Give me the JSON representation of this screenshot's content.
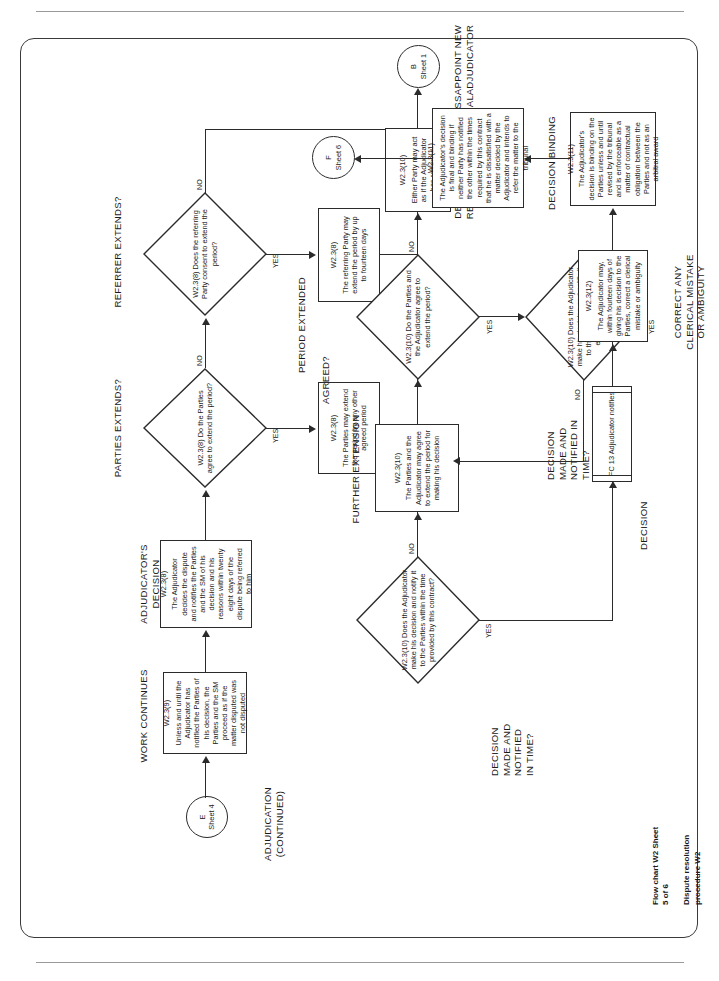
{
  "sheet": {
    "caption_line1": "Flow chart W2 Sheet 5 of 6",
    "caption_line2": "Dispute resolution procedure W2"
  },
  "section_headers": {
    "adjudication": "ADJUDICATION\n(CONTINUED)",
    "work_continues": "WORK CONTINUES",
    "adjudicators_decision": "ADJUDICATOR'S DECISION",
    "parties_extends": "PARTIES EXTENDS?",
    "referrer_extends": "REFERRER EXTENDS?",
    "period_extended": "PERIOD EXTENDED",
    "decision_made_notified_1": "DECISION\nMADE AND\nNOTIFIED\nIN TIME?",
    "further_extension": "FURTHER EXTENSION",
    "agreed": "AGREED?",
    "decision_made_notified_2": "DECISION\nMADE AND\nNOTIFIED IN\nTIME?",
    "appoint_new_adjudicator": "APPOINT NEW\nADJUDICATOR",
    "decision": "DECISION",
    "correct_any_clerical": "CORRECT ANY\nCLERICAL MISTAKE\nOR AMBIGUITY",
    "decision_binding": "DECISION BINDING",
    "decision_final": "DECISION FINAL UNLESS\nREFERRED TO TRIBUNAL"
  },
  "connectors": {
    "entry": {
      "letter": "E",
      "sheet": "Sheet 4"
    },
    "exit_b": {
      "letter": "B",
      "sheet": "Sheet 1"
    },
    "exit_f": {
      "letter": "F",
      "sheet": "Sheet 6"
    }
  },
  "nodes": {
    "work_continues": {
      "ref": "W2.3(9)",
      "text": "Unless and until the Adjudicator has notified the Parties of his decision, the Parties and the SM proceed as if the matter disputed was not disputed"
    },
    "adjudicators_decision": {
      "ref": "W2.3(8)",
      "text": "The Adjudicator decides the dispute and notifies the Parties and the SM of his decision and his reasons within twenty eight days of the dispute being referred to him"
    },
    "parties_extends_q": {
      "ref": "W2.3(8)",
      "text": "Do the Parties agree to extend the period?"
    },
    "parties_extend_action": {
      "ref": "W2.3(8)",
      "text": "The Parties may extend the period by any other agreed period"
    },
    "referrer_extends_q": {
      "ref": "W2.3(8)",
      "text": "Does the referring Party consent to extend the period?"
    },
    "referrer_extend_action": {
      "ref": "W2.3(8)",
      "text": "The referring Party may extend the period by up to fourteen days"
    },
    "decision_in_time_q1": {
      "ref": "W2.3(10)",
      "text": "Does the Adjudicator make his decision and notify it to the Parties within the time provided by this contract?"
    },
    "further_extension": {
      "ref": "W2.3(10)",
      "text": "The Parties and the Adjudicator may agree to extend the period for making his decision"
    },
    "agreed_q": {
      "ref": "W2.3(10)",
      "text": "Do the Parties and the Adjudicator agree to extend the period?"
    },
    "decision_in_time_q2": {
      "ref": "W2.3(10)",
      "text": "Does the Adjudicator make his decision and notify it to the Parties within the extended period?"
    },
    "either_party_resigned": {
      "ref": "W2.3(10)",
      "text": "Either Party may act as if the Adjudicator has resigned"
    },
    "fc13": {
      "ref": "FC 13",
      "text": "Adjudicator notifies"
    },
    "clerical_mistake": {
      "ref": "W2.3(12)",
      "text": "The Adjudicator may, within fourteen days of giving his decision to the Parties, correct a clerical mistake or ambiguity"
    },
    "decision_binding": {
      "ref": "W2.3(11)",
      "text": "The Adjudicator's decision is binding on the Parties unless and until revised by the tribunal and is enforceable as a matter of contractual obligation between the Parties and not as an arbitral award"
    },
    "decision_final": {
      "ref": "W2.3(11)",
      "text": "The Adjudicator's decision is final and binding if neither Party has notified the other within the times required by this contract that he is dissatisfied with a matter decided by the Adjudicator and intends to refer the matter to the tribunal"
    }
  },
  "branch_labels": {
    "yes": "YES",
    "no": "NO"
  }
}
